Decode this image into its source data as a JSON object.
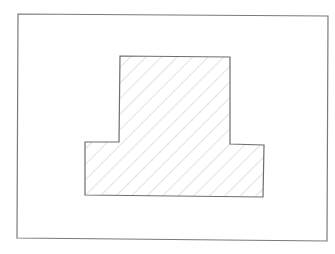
{
  "diagram": {
    "type": "cross-section",
    "frame": {
      "points": [
        [
          18,
          14
        ],
        [
          328,
          16
        ],
        [
          327,
          241
        ],
        [
          17,
          238
        ]
      ],
      "stroke": "#7a7a7a"
    },
    "shape": {
      "name": "t-section",
      "points": [
        [
          120,
          56
        ],
        [
          230,
          57
        ],
        [
          230,
          144
        ],
        [
          264,
          145
        ],
        [
          263,
          197
        ],
        [
          85,
          195
        ],
        [
          85,
          142
        ],
        [
          119,
          142
        ]
      ],
      "stroke": "#6e6e6e",
      "hatch": {
        "angle_deg": 45,
        "spacing_px": 11,
        "color": "#c4c4c4"
      }
    }
  }
}
